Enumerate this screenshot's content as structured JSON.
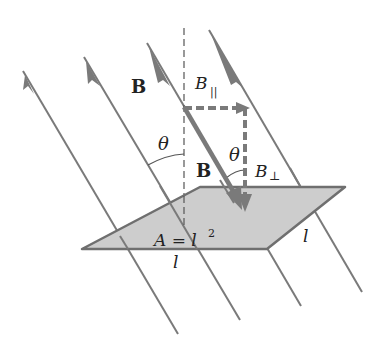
{
  "diagram": {
    "labels": {
      "field_B": "B",
      "vector_B": "B",
      "B_parallel": "B",
      "B_parallel_sub": "||",
      "B_perp": "B",
      "B_perp_sub": "⊥",
      "theta_left": "θ",
      "theta_right": "θ",
      "area": "A = l",
      "area_exp": "2",
      "side_bottom": "l",
      "side_right": "l"
    },
    "colors": {
      "field_line": "#7a7a7a",
      "vector": "#7a7a7a",
      "plate_fill": "#cdcdcd",
      "plate_edge": "#6f6f6f",
      "normal_dashed": "#555555",
      "text": "#222222"
    }
  }
}
